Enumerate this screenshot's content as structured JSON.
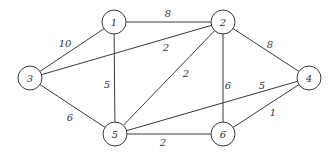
{
  "graph": {
    "type": "weighted-undirected-graph",
    "node_radius": 12,
    "colors": {
      "stroke": "#3a3a3a",
      "text": "#333333",
      "background": "#ffffff"
    },
    "nodes": [
      {
        "id": "1",
        "label": "1",
        "x": 114,
        "y": 22
      },
      {
        "id": "2",
        "label": "2",
        "x": 223,
        "y": 22
      },
      {
        "id": "3",
        "label": "3",
        "x": 30,
        "y": 78
      },
      {
        "id": "4",
        "label": "4",
        "x": 309,
        "y": 78
      },
      {
        "id": "5",
        "label": "5",
        "x": 115,
        "y": 134
      },
      {
        "id": "6",
        "label": "6",
        "x": 223,
        "y": 134
      }
    ],
    "edges": [
      {
        "from": "1",
        "to": "2",
        "weight": "8",
        "lx": 168,
        "ly": 13
      },
      {
        "from": "1",
        "to": "3",
        "weight": "10",
        "lx": 65,
        "ly": 43
      },
      {
        "from": "1",
        "to": "5",
        "weight": "5",
        "lx": 107,
        "ly": 84
      },
      {
        "from": "3",
        "to": "2",
        "weight": "2",
        "lx": 166,
        "ly": 47
      },
      {
        "from": "3",
        "to": "5",
        "weight": "6",
        "lx": 70,
        "ly": 117
      },
      {
        "from": "2",
        "to": "5",
        "weight": "2",
        "lx": 186,
        "ly": 73
      },
      {
        "from": "2",
        "to": "6",
        "weight": "6",
        "lx": 228,
        "ly": 85
      },
      {
        "from": "2",
        "to": "4",
        "weight": "8",
        "lx": 270,
        "ly": 44
      },
      {
        "from": "5",
        "to": "4",
        "weight": "5",
        "lx": 262,
        "ly": 85
      },
      {
        "from": "5",
        "to": "6",
        "weight": "2",
        "lx": 163,
        "ly": 142
      },
      {
        "from": "6",
        "to": "4",
        "weight": "1",
        "lx": 273,
        "ly": 112
      }
    ]
  }
}
